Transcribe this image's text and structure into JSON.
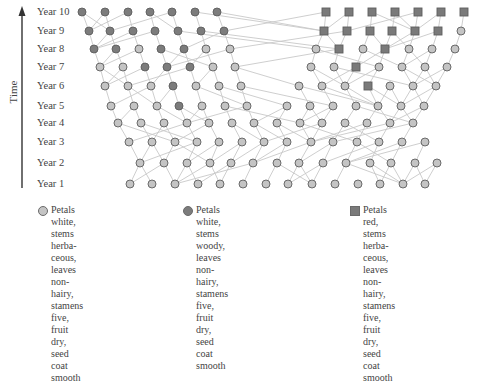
{
  "axis": {
    "label": "Time",
    "arrow_x": 22,
    "arrow_top": 6,
    "arrow_bottom": 188
  },
  "colors": {
    "white_herb_fill": "#c4c4c4",
    "white_woody_fill": "#7c7c7c",
    "red_herb_fill": "#7a7a7a",
    "node_stroke": "#5e5e5e",
    "edge": "#c8c8c8",
    "axis": "#333333"
  },
  "rows": [
    {
      "label": "Year 10",
      "y": 12,
      "nodes": [
        [
          82,
          "W"
        ],
        [
          105,
          "W"
        ],
        [
          128,
          "W"
        ],
        [
          150,
          "W"
        ],
        [
          172,
          "W"
        ],
        [
          195,
          "W"
        ],
        [
          217,
          "W"
        ],
        [
          326,
          "R"
        ],
        [
          349,
          "R"
        ],
        [
          372,
          "R"
        ],
        [
          395,
          "R"
        ],
        [
          418,
          "R"
        ],
        [
          441,
          "R"
        ],
        [
          464,
          "R"
        ]
      ]
    },
    {
      "label": "Year 9",
      "y": 31,
      "nodes": [
        [
          89,
          "W"
        ],
        [
          110,
          "W"
        ],
        [
          133,
          "W"
        ],
        [
          155,
          "W"
        ],
        [
          178,
          "W"
        ],
        [
          201,
          "W"
        ],
        [
          224,
          "W"
        ],
        [
          324,
          "R"
        ],
        [
          347,
          "R"
        ],
        [
          370,
          "R"
        ],
        [
          392,
          "R"
        ],
        [
          415,
          "R"
        ],
        [
          438,
          "R"
        ],
        [
          461,
          "H"
        ]
      ]
    },
    {
      "label": "Year 8",
      "y": 49,
      "nodes": [
        [
          94,
          "W"
        ],
        [
          116,
          "W"
        ],
        [
          139,
          "H"
        ],
        [
          161,
          "W"
        ],
        [
          184,
          "W"
        ],
        [
          206,
          "H"
        ],
        [
          230,
          "H"
        ],
        [
          316,
          "H"
        ],
        [
          339,
          "R"
        ],
        [
          363,
          "H"
        ],
        [
          385,
          "R"
        ],
        [
          409,
          "H"
        ],
        [
          432,
          "H"
        ],
        [
          455,
          "H"
        ]
      ]
    },
    {
      "label": "Year 7",
      "y": 67,
      "nodes": [
        [
          100,
          "H"
        ],
        [
          123,
          "H"
        ],
        [
          145,
          "W"
        ],
        [
          167,
          "W"
        ],
        [
          190,
          "W"
        ],
        [
          213,
          "H"
        ],
        [
          235,
          "H"
        ],
        [
          311,
          "H"
        ],
        [
          334,
          "H"
        ],
        [
          356,
          "R"
        ],
        [
          379,
          "H"
        ],
        [
          402,
          "H"
        ],
        [
          425,
          "H"
        ],
        [
          447,
          "H"
        ]
      ]
    },
    {
      "label": "Year 6",
      "y": 86,
      "nodes": [
        [
          105,
          "H"
        ],
        [
          128,
          "H"
        ],
        [
          151,
          "H"
        ],
        [
          173,
          "W"
        ],
        [
          196,
          "H"
        ],
        [
          219,
          "H"
        ],
        [
          241,
          "H"
        ],
        [
          299,
          "H"
        ],
        [
          322,
          "H"
        ],
        [
          345,
          "H"
        ],
        [
          368,
          "R"
        ],
        [
          390,
          "H"
        ],
        [
          413,
          "H"
        ],
        [
          436,
          "H"
        ]
      ]
    },
    {
      "label": "Year 5",
      "y": 106,
      "nodes": [
        [
          111,
          "H"
        ],
        [
          134,
          "H"
        ],
        [
          157,
          "H"
        ],
        [
          179,
          "W"
        ],
        [
          202,
          "H"
        ],
        [
          225,
          "H"
        ],
        [
          247,
          "H"
        ],
        [
          287,
          "H"
        ],
        [
          310,
          "H"
        ],
        [
          333,
          "H"
        ],
        [
          356,
          "H"
        ],
        [
          378,
          "H"
        ],
        [
          401,
          "H"
        ],
        [
          424,
          "H"
        ]
      ]
    },
    {
      "label": "Year 4",
      "y": 123,
      "nodes": [
        [
          118,
          "H"
        ],
        [
          141,
          "H"
        ],
        [
          164,
          "H"
        ],
        [
          187,
          "H"
        ],
        [
          209,
          "H"
        ],
        [
          232,
          "H"
        ],
        [
          254,
          "H"
        ],
        [
          277,
          "H"
        ],
        [
          300,
          "H"
        ],
        [
          322,
          "H"
        ],
        [
          345,
          "H"
        ],
        [
          367,
          "H"
        ],
        [
          390,
          "H"
        ],
        [
          413,
          "H"
        ]
      ]
    },
    {
      "label": "Year 3",
      "y": 142,
      "nodes": [
        [
          129,
          "H"
        ],
        [
          152,
          "H"
        ],
        [
          175,
          "H"
        ],
        [
          197,
          "H"
        ],
        [
          219,
          "H"
        ],
        [
          242,
          "H"
        ],
        [
          264,
          "H"
        ],
        [
          287,
          "H"
        ],
        [
          311,
          "H"
        ],
        [
          333,
          "H"
        ],
        [
          357,
          "H"
        ],
        [
          379,
          "H"
        ],
        [
          402,
          "H"
        ],
        [
          425,
          "H"
        ]
      ]
    },
    {
      "label": "Year 2",
      "y": 163,
      "nodes": [
        [
          140,
          "H"
        ],
        [
          164,
          "H"
        ],
        [
          187,
          "H"
        ],
        [
          210,
          "H"
        ],
        [
          231,
          "H"
        ],
        [
          253,
          "H"
        ],
        [
          277,
          "H"
        ],
        [
          299,
          "H"
        ],
        [
          323,
          "H"
        ],
        [
          346,
          "H"
        ],
        [
          370,
          "H"
        ],
        [
          391,
          "H"
        ],
        [
          415,
          "H"
        ],
        [
          437,
          "H"
        ]
      ]
    },
    {
      "label": "Year 1",
      "y": 184,
      "nodes": [
        [
          130,
          "H"
        ],
        [
          152,
          "H"
        ],
        [
          175,
          "H"
        ],
        [
          198,
          "H"
        ],
        [
          220,
          "H"
        ],
        [
          243,
          "H"
        ],
        [
          266,
          "H"
        ],
        [
          288,
          "H"
        ],
        [
          312,
          "H"
        ],
        [
          335,
          "H"
        ],
        [
          358,
          "H"
        ],
        [
          380,
          "H"
        ],
        [
          403,
          "H"
        ],
        [
          425,
          "H"
        ]
      ]
    }
  ],
  "legend": [
    {
      "key": "H",
      "shape": "circle",
      "x": 38,
      "text": "Petals white, stems herba-\nceous, leaves non-hairy,\nstamens five, fruit dry,\nseed coat smooth"
    },
    {
      "key": "W",
      "shape": "circle",
      "x": 183,
      "text": "Petals white, stems woody,\nleaves non-hairy, stamens five,\nfruit dry, seed coat smooth"
    },
    {
      "key": "R",
      "shape": "square",
      "x": 350,
      "text": "Petals red, stems herba-\nceous, leaves non-hairy,\nstamens five, fruit dry,\nseed coat smooth"
    }
  ]
}
